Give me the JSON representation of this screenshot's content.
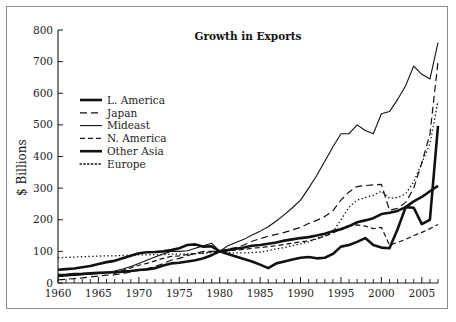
{
  "chart_data": {
    "type": "line",
    "title": "Growth in Exports",
    "xlabel": "",
    "ylabel": "$ Billions",
    "xlim": [
      1960,
      2007
    ],
    "ylim": [
      0,
      800
    ],
    "ytick_labels": [
      "0",
      "100",
      "200",
      "300",
      "400",
      "500",
      "600",
      "700",
      "800"
    ],
    "ytick_values": [
      0,
      100,
      200,
      300,
      400,
      500,
      600,
      700,
      800
    ],
    "xtick_labels": [
      "1960",
      "1965",
      "1970",
      "1975",
      "1980",
      "1985",
      "1990",
      "1995",
      "2000",
      "2005"
    ],
    "xtick_values": [
      1960,
      1965,
      1970,
      1975,
      1980,
      1985,
      1990,
      1995,
      2000,
      2005
    ],
    "minor_xtick_interval": 1,
    "grid": false,
    "legend_position": "upper-left-inside",
    "x": [
      1960,
      1961,
      1962,
      1963,
      1964,
      1965,
      1966,
      1967,
      1968,
      1969,
      1970,
      1971,
      1972,
      1973,
      1974,
      1975,
      1976,
      1977,
      1978,
      1979,
      1980,
      1981,
      1982,
      1983,
      1984,
      1985,
      1986,
      1987,
      1988,
      1989,
      1990,
      1991,
      1992,
      1993,
      1994,
      1995,
      1996,
      1997,
      1998,
      1999,
      2000,
      2001,
      2002,
      2003,
      2004,
      2005,
      2006,
      2007
    ],
    "series": [
      {
        "name": "L. America",
        "style": "solid-heavy",
        "values": [
          25,
          26,
          28,
          29,
          31,
          32,
          33,
          34,
          36,
          38,
          41,
          43,
          47,
          55,
          62,
          64,
          68,
          72,
          78,
          88,
          100,
          104,
          108,
          112,
          118,
          120,
          124,
          128,
          134,
          138,
          142,
          145,
          150,
          156,
          164,
          170,
          180,
          192,
          198,
          205,
          218,
          222,
          228,
          240,
          258,
          272,
          290,
          307
        ]
      },
      {
        "name": "Japan",
        "style": "dashed-long",
        "values": [
          10,
          12,
          14,
          16,
          19,
          22,
          25,
          26,
          30,
          35,
          40,
          45,
          52,
          62,
          72,
          78,
          86,
          94,
          100,
          100,
          100,
          108,
          112,
          120,
          132,
          140,
          148,
          154,
          160,
          168,
          176,
          188,
          198,
          210,
          228,
          262,
          288,
          305,
          308,
          310,
          312,
          230,
          236,
          255,
          300,
          380,
          470,
          700
        ]
      },
      {
        "name": "Mideast",
        "style": "solid-thin",
        "values": [
          20,
          22,
          24,
          26,
          28,
          30,
          34,
          38,
          44,
          52,
          62,
          72,
          82,
          92,
          100,
          100,
          102,
          110,
          118,
          126,
          100,
          118,
          128,
          138,
          152,
          164,
          178,
          196,
          216,
          238,
          262,
          300,
          340,
          385,
          430,
          472,
          472,
          500,
          482,
          472,
          535,
          542,
          580,
          624,
          686,
          660,
          645,
          760
        ]
      },
      {
        "name": "N. America",
        "style": "dashed-short",
        "values": [
          22,
          23,
          25,
          27,
          29,
          31,
          34,
          30,
          40,
          48,
          56,
          62,
          70,
          78,
          84,
          86,
          90,
          93,
          95,
          99,
          100,
          102,
          104,
          106,
          110,
          112,
          115,
          118,
          122,
          126,
          130,
          133,
          140,
          148,
          158,
          172,
          180,
          184,
          180,
          172,
          176,
          120,
          128,
          138,
          150,
          160,
          172,
          185
        ]
      },
      {
        "name": "Other Asia",
        "style": "solid-heavy",
        "values": [
          42,
          44,
          46,
          50,
          54,
          60,
          66,
          70,
          78,
          86,
          94,
          97,
          98,
          100,
          104,
          110,
          120,
          122,
          115,
          116,
          100,
          92,
          84,
          76,
          68,
          58,
          47,
          62,
          68,
          74,
          80,
          82,
          78,
          80,
          92,
          115,
          120,
          130,
          142,
          120,
          112,
          110,
          170,
          240,
          238,
          186,
          200,
          497
        ]
      },
      {
        "name": "Europe",
        "style": "dotted",
        "values": [
          80,
          81,
          82,
          83,
          84,
          85,
          86,
          86,
          87,
          88,
          89,
          89,
          90,
          90,
          91,
          91,
          92,
          93,
          94,
          96,
          98,
          96,
          95,
          95,
          96,
          98,
          102,
          108,
          112,
          118,
          124,
          130,
          140,
          150,
          162,
          200,
          240,
          262,
          270,
          278,
          290,
          268,
          270,
          282,
          320,
          380,
          440,
          575
        ]
      }
    ]
  },
  "legend": {
    "items": [
      {
        "label": "L. America",
        "style": "solid-heavy"
      },
      {
        "label": "Japan",
        "style": "dashed-long"
      },
      {
        "label": "Mideast",
        "style": "solid-thin"
      },
      {
        "label": "N. America",
        "style": "dashed-short"
      },
      {
        "label": "Other Asia",
        "style": "solid-heavy"
      },
      {
        "label": "Europe",
        "style": "dotted"
      }
    ]
  },
  "colors": {
    "ink": "#111111",
    "frame": "#8d8d8d",
    "background": "#ffffff"
  }
}
